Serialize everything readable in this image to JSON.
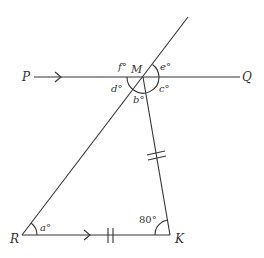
{
  "diagram": {
    "type": "geometry",
    "points": {
      "P": {
        "label": "P"
      },
      "Q": {
        "label": "Q"
      },
      "M": {
        "label": "M"
      },
      "R": {
        "label": "R"
      },
      "K": {
        "label": "K"
      }
    },
    "angles": {
      "a": "a°",
      "b": "b°",
      "c": "c°",
      "d": "d°",
      "e": "e°",
      "f": "f°",
      "k": "80°"
    },
    "markers": {
      "parallel_arrows": [
        "PQ",
        "RK"
      ],
      "equal_ticks": [
        "MK",
        "RK"
      ]
    },
    "colors": {
      "stroke": "#333333",
      "background": "#ffffff"
    }
  }
}
